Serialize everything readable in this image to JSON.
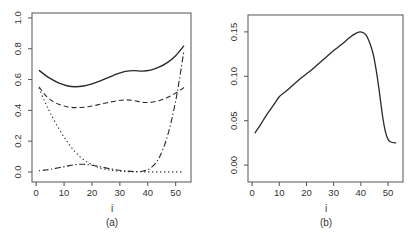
{
  "figure": {
    "background": "#ffffff",
    "line_color": "#2a2a2a",
    "axis_color": "#555555",
    "text_color": "#333333"
  },
  "chart_data": [
    {
      "type": "line",
      "title": "",
      "caption": "(a)",
      "xlabel": "i",
      "ylabel": "",
      "grid": false,
      "frame": "box",
      "legend": "none",
      "xlim": [
        -1.5,
        55.5
      ],
      "ylim": [
        -0.065,
        1.032
      ],
      "xticks": [
        0,
        10,
        20,
        30,
        40,
        50
      ],
      "xtick_labels": [
        "0",
        "10",
        "20",
        "30",
        "40",
        "50"
      ],
      "yticks": [
        0.0,
        0.2,
        0.4,
        0.6,
        0.8,
        1.0
      ],
      "ytick_labels": [
        "0.0",
        "0.2",
        "0.4",
        "0.6",
        "0.8",
        "1.0"
      ],
      "x": [
        1,
        3,
        5,
        8,
        11,
        14,
        17,
        20,
        23,
        26,
        29,
        32,
        35,
        38,
        41,
        44,
        47,
        50,
        53
      ],
      "series": [
        {
          "name": "solid-curve",
          "linestyle": "solid",
          "linewidth": 1.4,
          "values": [
            0.66,
            0.632,
            0.607,
            0.578,
            0.56,
            0.553,
            0.558,
            0.572,
            0.592,
            0.614,
            0.637,
            0.653,
            0.658,
            0.655,
            0.661,
            0.68,
            0.71,
            0.755,
            0.82
          ]
        },
        {
          "name": "dashed-curve",
          "linestyle": "dashed",
          "linewidth": 1.1,
          "values": [
            0.553,
            0.505,
            0.47,
            0.44,
            0.424,
            0.418,
            0.42,
            0.428,
            0.44,
            0.452,
            0.462,
            0.468,
            0.464,
            0.452,
            0.452,
            0.463,
            0.483,
            0.512,
            0.548
          ]
        },
        {
          "name": "dotted-curve",
          "linestyle": "dotted",
          "linewidth": 1.1,
          "values": [
            0.545,
            0.46,
            0.385,
            0.285,
            0.2,
            0.13,
            0.08,
            0.048,
            0.026,
            0.013,
            0.006,
            0.003,
            0.002,
            0.001,
            0.001,
            0.001,
            0.001,
            0.001,
            0.001
          ]
        },
        {
          "name": "dotdash-curve",
          "linestyle": "dotdash",
          "linewidth": 1.1,
          "values": [
            0.008,
            0.012,
            0.017,
            0.027,
            0.038,
            0.048,
            0.05,
            0.044,
            0.034,
            0.022,
            0.013,
            0.007,
            0.003,
            0.005,
            0.025,
            0.09,
            0.23,
            0.46,
            0.79
          ]
        }
      ]
    },
    {
      "type": "line",
      "title": "",
      "caption": "(b)",
      "xlabel": "i",
      "ylabel": "",
      "grid": false,
      "frame": "box",
      "legend": "none",
      "xlim": [
        -1.5,
        55.5
      ],
      "ylim": [
        -0.019,
        0.169
      ],
      "xticks": [
        0,
        10,
        20,
        30,
        40,
        50
      ],
      "xtick_labels": [
        "0",
        "10",
        "20",
        "30",
        "40",
        "50"
      ],
      "yticks": [
        0.0,
        0.05,
        0.1,
        0.15
      ],
      "ytick_labels": [
        "0.00",
        "0.05",
        "0.10",
        "0.15"
      ],
      "x": [
        1,
        3,
        5,
        8,
        10,
        12,
        15,
        18,
        21,
        24,
        27,
        30,
        33,
        36,
        38,
        40,
        42,
        44,
        45,
        46,
        47,
        48,
        49,
        50,
        51,
        53
      ],
      "series": [
        {
          "name": "solid-curve",
          "linestyle": "solid",
          "linewidth": 1.3,
          "values": [
            0.036,
            0.045,
            0.055,
            0.068,
            0.077,
            0.082,
            0.09,
            0.098,
            0.105,
            0.113,
            0.121,
            0.129,
            0.136,
            0.144,
            0.148,
            0.15,
            0.146,
            0.131,
            0.118,
            0.1,
            0.078,
            0.055,
            0.038,
            0.029,
            0.026,
            0.025
          ]
        }
      ]
    }
  ]
}
